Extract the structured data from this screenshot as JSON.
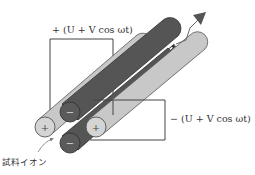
{
  "diagram": {
    "labels": {
      "positive_voltage": "+ (U + V cos ωt)",
      "negative_voltage": "− (U + V cos ωt)",
      "sample_ion": "試料イオン"
    },
    "rods": [
      {
        "id": "back-left",
        "sign": "+",
        "color": "#c8c8c8"
      },
      {
        "id": "upper-center",
        "sign": "−",
        "color": "#555555"
      },
      {
        "id": "front-right",
        "sign": "+",
        "color": "#c8c8c8"
      },
      {
        "id": "bottom-center",
        "sign": "−",
        "color": "#555555"
      }
    ],
    "colors": {
      "light_rod": "#c8c8c8",
      "dark_rod": "#555555",
      "outline": "#444444",
      "arrow": "#555555"
    }
  }
}
